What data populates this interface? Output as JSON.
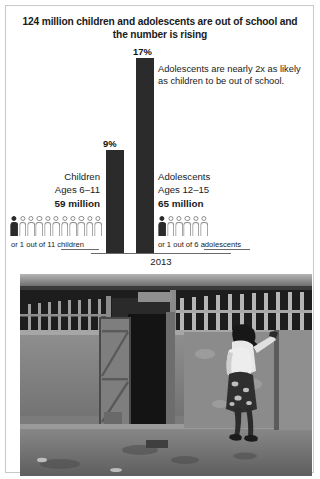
{
  "headline": "124 million children and adolescents are out of school and the number is rising",
  "callout": "Adolescents are nearly 2x as likely as children to be out of school.",
  "axis": {
    "year": "2013"
  },
  "groups": {
    "children": {
      "name": "Children",
      "ages": "Ages 6–11",
      "count": "59 million",
      "percent_label": "9%",
      "caption": "or 1 out of 11 children"
    },
    "adolescents": {
      "name": "Adolescents",
      "ages": "Ages 12–15",
      "count": "65 million",
      "percent_label": "17%",
      "caption": "or 1 out of 6 adolescents"
    }
  },
  "photo": {
    "alt": "Black and white photograph of a girl with a backpack standing outside a school building, peering through a barred window beside an open wooden door."
  },
  "colors": {
    "bar": "#2b2b2b",
    "picto_outline": "#8e8e8e",
    "picto_filled": "#2b2b2b",
    "axis": "#6a6a6a",
    "border": "#c9c9c9",
    "text": "#1a1a1a",
    "background": "#ffffff"
  },
  "chart_data": {
    "type": "bar",
    "title": "124 million children and adolescents are out of school and the number is rising",
    "subtitle": "Adolescents are nearly 2x as likely as children to be out of school.",
    "xlabel": "2013",
    "ylabel": "Out-of-school rate (%)",
    "categories": [
      "Children",
      "Adolescents"
    ],
    "values": [
      9,
      17
    ],
    "value_labels": [
      "9%",
      "17%"
    ],
    "ylim": [
      0,
      17
    ],
    "grid": false,
    "legend": "none",
    "annotations": [
      "Children, Ages 6–11, 59 million, or 1 out of 11 children",
      "Adolescents, Ages 12–15, 65 million, or 1 out of 6 adolescents"
    ],
    "pictogram": {
      "children": {
        "total": 11,
        "filled": 1
      },
      "adolescents": {
        "total": 6,
        "filled": 1
      }
    }
  }
}
